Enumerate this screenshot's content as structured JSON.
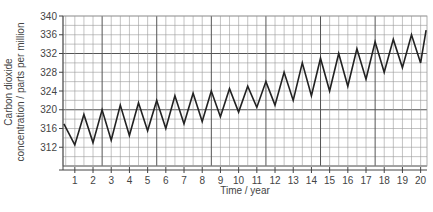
{
  "chart_data": {
    "type": "line",
    "title": "",
    "xlabel": "Time / year",
    "ylabel_line1": "Carbon dioxide",
    "ylabel_line2": "concentration / parts per million",
    "ylim": [
      308,
      340
    ],
    "xlim": [
      0.35,
      20.35
    ],
    "yticks": [
      312,
      316,
      320,
      324,
      328,
      332,
      336,
      340
    ],
    "xticks": [
      1,
      2,
      3,
      4,
      5,
      6,
      7,
      8,
      9,
      10,
      11,
      12,
      13,
      14,
      15,
      16,
      17,
      18,
      19,
      20
    ],
    "grid": true,
    "legend": "none",
    "series": [
      {
        "name": "CO2 concentration",
        "color": "#222222",
        "x": [
          0.4,
          1.0,
          1.5,
          2.0,
          2.5,
          3.0,
          3.5,
          4.0,
          4.5,
          5.0,
          5.5,
          6.0,
          6.5,
          7.0,
          7.5,
          8.0,
          8.5,
          9.0,
          9.5,
          10.0,
          10.5,
          11.0,
          11.5,
          12.0,
          12.5,
          13.0,
          13.5,
          14.0,
          14.5,
          15.0,
          15.5,
          16.0,
          16.5,
          17.0,
          17.5,
          18.0,
          18.5,
          19.0,
          19.5,
          20.0,
          20.3
        ],
        "y": [
          317,
          312.5,
          319,
          313,
          320,
          313.5,
          321,
          314.5,
          321.5,
          315.5,
          322,
          316,
          323,
          317,
          323.5,
          317.5,
          324,
          318.5,
          324.5,
          319.5,
          325,
          320.5,
          326,
          321,
          328,
          322,
          330,
          323,
          331,
          324,
          332,
          325,
          333,
          326.5,
          334.5,
          328,
          335,
          329,
          336,
          330,
          337
        ]
      }
    ]
  },
  "colors": {
    "grid_minor": "#9a9a9a",
    "grid_major": "#555555",
    "line": "#222222"
  }
}
